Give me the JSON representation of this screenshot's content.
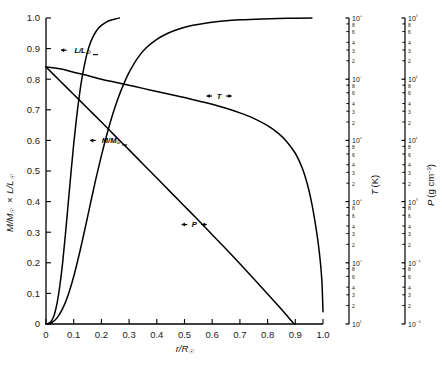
{
  "chart_data": {
    "type": "line",
    "title": "",
    "xlabel": "r/R☉",
    "ylabel": "M/M☉ × L/L☉",
    "xlim": [
      0,
      1.0
    ],
    "ylim": [
      0,
      1.0
    ],
    "grid": false,
    "legend": "inline-curve-labels",
    "x_ticks": [
      "0",
      "0.1",
      "0.2",
      "0.3",
      "0.4",
      "0.5",
      "0.6",
      "0.7",
      "0.8",
      "0.9",
      "1.0"
    ],
    "y_ticks": [
      "0",
      "0.1",
      "0.2",
      "0.3",
      "0.4",
      "0.5",
      "0.6",
      "0.7",
      "0.8",
      "0.9",
      "1.0"
    ],
    "secondary_axes": [
      {
        "name": "temperature-axis",
        "label": "T (K)",
        "label_symbol": "T",
        "label_unit": "(K)",
        "scale": "log",
        "lim": [
          1000,
          100000000
        ],
        "decade_labels": [
          "10⁸",
          "10⁷",
          "10⁶",
          "10⁵",
          "10⁴",
          "10³"
        ],
        "minor_labels": [
          "8",
          "6",
          "4",
          "3",
          "2"
        ]
      },
      {
        "name": "pressure-density-axis",
        "label": "P (g cm⁻³)",
        "label_symbol": "P",
        "label_unit": "(g cm⁻³)",
        "scale": "log",
        "lim": [
          0.01,
          1000
        ],
        "decade_labels": [
          "10³",
          "10²",
          "10¹",
          "10⁰",
          "10⁻¹",
          "10⁻²"
        ],
        "minor_labels": [
          "8",
          "6",
          "4",
          "3",
          "2"
        ]
      }
    ],
    "series": [
      {
        "name": "L/L☉",
        "symbol": "L/L",
        "sub": "☉",
        "axis": "left",
        "label_position": {
          "x": 0.13,
          "y": 0.895
        },
        "points": [
          [
            0.0,
            0.0
          ],
          [
            0.01,
            0.002
          ],
          [
            0.02,
            0.01
          ],
          [
            0.03,
            0.03
          ],
          [
            0.04,
            0.068
          ],
          [
            0.05,
            0.125
          ],
          [
            0.06,
            0.2
          ],
          [
            0.07,
            0.292
          ],
          [
            0.08,
            0.392
          ],
          [
            0.09,
            0.492
          ],
          [
            0.1,
            0.588
          ],
          [
            0.11,
            0.672
          ],
          [
            0.12,
            0.744
          ],
          [
            0.13,
            0.805
          ],
          [
            0.14,
            0.852
          ],
          [
            0.15,
            0.89
          ],
          [
            0.16,
            0.918
          ],
          [
            0.17,
            0.939
          ],
          [
            0.18,
            0.955
          ],
          [
            0.19,
            0.967
          ],
          [
            0.2,
            0.976
          ],
          [
            0.215,
            0.985
          ],
          [
            0.23,
            0.992
          ],
          [
            0.25,
            0.997
          ],
          [
            0.265,
            1.0
          ]
        ]
      },
      {
        "name": "M/M☉",
        "symbol": "M/M",
        "sub": "☉",
        "axis": "left",
        "label_position": {
          "x": 0.235,
          "y": 0.6
        },
        "points": [
          [
            0.0,
            0.0
          ],
          [
            0.02,
            0.004
          ],
          [
            0.04,
            0.02
          ],
          [
            0.06,
            0.05
          ],
          [
            0.08,
            0.095
          ],
          [
            0.1,
            0.155
          ],
          [
            0.12,
            0.228
          ],
          [
            0.14,
            0.308
          ],
          [
            0.16,
            0.392
          ],
          [
            0.18,
            0.474
          ],
          [
            0.2,
            0.55
          ],
          [
            0.22,
            0.62
          ],
          [
            0.24,
            0.683
          ],
          [
            0.26,
            0.737
          ],
          [
            0.28,
            0.783
          ],
          [
            0.3,
            0.822
          ],
          [
            0.33,
            0.868
          ],
          [
            0.36,
            0.901
          ],
          [
            0.4,
            0.93
          ],
          [
            0.44,
            0.95
          ],
          [
            0.48,
            0.964
          ],
          [
            0.53,
            0.976
          ],
          [
            0.58,
            0.984
          ],
          [
            0.64,
            0.99
          ],
          [
            0.7,
            0.994
          ],
          [
            0.78,
            0.997
          ],
          [
            0.87,
            0.999
          ],
          [
            0.96,
            1.0
          ]
        ]
      },
      {
        "name": "T",
        "symbol": "T",
        "axis": "temperature",
        "label_position": {
          "x": 0.625,
          "y": 0.745
        },
        "points": [
          [
            0.0,
            0.84
          ],
          [
            0.05,
            0.834
          ],
          [
            0.1,
            0.823
          ],
          [
            0.15,
            0.812
          ],
          [
            0.2,
            0.8
          ],
          [
            0.25,
            0.79
          ],
          [
            0.3,
            0.78
          ],
          [
            0.35,
            0.77
          ],
          [
            0.4,
            0.76
          ],
          [
            0.45,
            0.75
          ],
          [
            0.5,
            0.74
          ],
          [
            0.55,
            0.729
          ],
          [
            0.6,
            0.718
          ],
          [
            0.65,
            0.705
          ],
          [
            0.7,
            0.69
          ],
          [
            0.75,
            0.672
          ],
          [
            0.8,
            0.648
          ],
          [
            0.84,
            0.622
          ],
          [
            0.87,
            0.595
          ],
          [
            0.9,
            0.558
          ],
          [
            0.925,
            0.51
          ],
          [
            0.945,
            0.452
          ],
          [
            0.96,
            0.392
          ],
          [
            0.972,
            0.33
          ],
          [
            0.98,
            0.282
          ],
          [
            0.987,
            0.232
          ],
          [
            0.992,
            0.188
          ],
          [
            0.996,
            0.14
          ],
          [
            0.998,
            0.095
          ],
          [
            1.0,
            0.04
          ]
        ]
      },
      {
        "name": "P",
        "symbol": "P",
        "axis": "pressure",
        "label_position": {
          "x": 0.535,
          "y": 0.325
        },
        "points": [
          [
            0.0,
            0.84
          ],
          [
            0.05,
            0.795
          ],
          [
            0.1,
            0.75
          ],
          [
            0.15,
            0.705
          ],
          [
            0.2,
            0.66
          ],
          [
            0.25,
            0.614
          ],
          [
            0.3,
            0.569
          ],
          [
            0.35,
            0.523
          ],
          [
            0.4,
            0.477
          ],
          [
            0.45,
            0.431
          ],
          [
            0.5,
            0.385
          ],
          [
            0.55,
            0.339
          ],
          [
            0.6,
            0.292
          ],
          [
            0.65,
            0.245
          ],
          [
            0.7,
            0.197
          ],
          [
            0.75,
            0.148
          ],
          [
            0.8,
            0.098
          ],
          [
            0.85,
            0.048
          ],
          [
            0.89,
            0.006
          ],
          [
            0.9,
            0.0
          ]
        ]
      }
    ]
  }
}
